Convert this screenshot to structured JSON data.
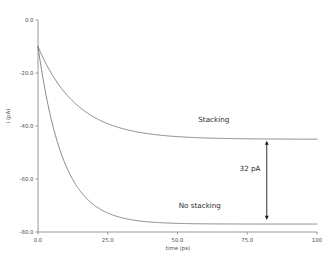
{
  "chart_data": {
    "type": "line",
    "title": "",
    "xlabel": "time (ps)",
    "ylabel": "i (pA)",
    "xlim": [
      0,
      100
    ],
    "ylim": [
      -80,
      0
    ],
    "grid": false,
    "legend_position": "inline-annotation",
    "xticks": [
      0,
      25,
      50,
      75,
      100
    ],
    "xticklabels": [
      "0.0",
      "25.0",
      "50.0",
      "75.0",
      "100"
    ],
    "yticks": [
      0,
      -20,
      -40,
      -60,
      -80
    ],
    "yticklabels": [
      "0.0",
      "-20.0",
      "-40.0",
      "-60.0",
      "-80.0"
    ],
    "series": [
      {
        "name": "Stacking",
        "color": "#6b6b6b",
        "start_value": -10.0,
        "plateau_value": -45.0,
        "decay_constant_ps": 14.0,
        "x": [
          0,
          1,
          2,
          3,
          5,
          7,
          10,
          13,
          16,
          20,
          25,
          30,
          35,
          40,
          50,
          60,
          70,
          80,
          90,
          100
        ],
        "y": [
          -10.0,
          -12.4,
          -14.6,
          -16.8,
          -20.8,
          -24.3,
          -28.8,
          -32.4,
          -35.3,
          -38.3,
          -41.0,
          -42.8,
          -43.9,
          -44.5,
          -45.0,
          -45.2,
          -45.3,
          -45.3,
          -45.3,
          -45.3
        ]
      },
      {
        "name": "No stacking",
        "color": "#6b6b6b",
        "start_value": -10.0,
        "plateau_value": -77.0,
        "decay_constant_ps": 9.0,
        "x": [
          0,
          1,
          2,
          3,
          5,
          7,
          10,
          13,
          16,
          20,
          25,
          30,
          35,
          40,
          50,
          60,
          70,
          80,
          90,
          100
        ],
        "y": [
          -10.0,
          -17.0,
          -23.3,
          -29.0,
          -38.6,
          -46.3,
          -55.2,
          -61.4,
          -65.8,
          -70.0,
          -73.2,
          -75.0,
          -76.0,
          -76.5,
          -76.9,
          -77.0,
          -77.0,
          -77.0,
          -77.0,
          -77.0
        ]
      }
    ],
    "annotations": [
      {
        "name": "stacking-label",
        "text": "Stacking",
        "x": 63,
        "y": -38.5
      },
      {
        "name": "no-stacking-label",
        "text": "No stacking",
        "x": 58,
        "y": -71.0
      },
      {
        "name": "difference-label",
        "text": "32 pA",
        "x": 76,
        "y": -57.0
      },
      {
        "name": "difference-arrow",
        "text": "",
        "x": 82,
        "y_top": -46.5,
        "y_bottom": -74.5
      }
    ]
  },
  "axes": {
    "x_axis_title": "time (ps)",
    "y_axis_title": "i (pA)"
  }
}
